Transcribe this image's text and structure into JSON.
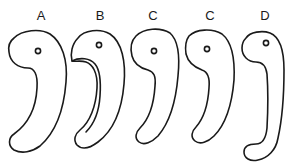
{
  "figure": {
    "stroke_color": "#1a1a1a",
    "background": "#ffffff",
    "shapes": [
      {
        "label": "A",
        "label_x": 41,
        "label_y": 9
      },
      {
        "label": "B",
        "label_x": 100,
        "label_y": 9
      },
      {
        "label": "C",
        "label_x": 153,
        "label_y": 9
      },
      {
        "label": "C",
        "label_x": 210,
        "label_y": 9
      },
      {
        "label": "D",
        "label_x": 265,
        "label_y": 9
      }
    ]
  }
}
